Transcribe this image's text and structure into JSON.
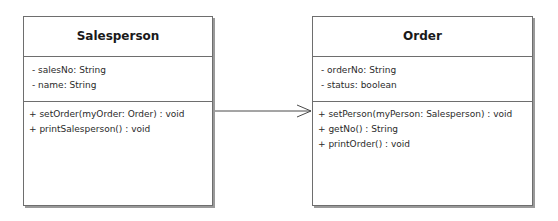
{
  "classes": [
    {
      "name": "Salesperson",
      "attributes": [
        "- salesNo: String",
        "- name: String"
      ],
      "operations": [
        "+ setOrder(myOrder: Order) : void",
        "+ printSalesperson() : void"
      ]
    },
    {
      "name": "Order",
      "attributes": [
        "- orderNo: String",
        "- status: boolean"
      ],
      "operations": [
        "+ setPerson(myPerson: Salesperson) : void",
        "+ getNo() : String",
        "+ printOrder() : void"
      ]
    }
  ],
  "association": {
    "from": "Salesperson",
    "to": "Order",
    "navigability": "directed arrow (open arrowhead)"
  },
  "colors": {
    "border": "#6e6e6e",
    "shadow": "#9a9a9a",
    "background": "#ffffff",
    "text": "#222222"
  }
}
